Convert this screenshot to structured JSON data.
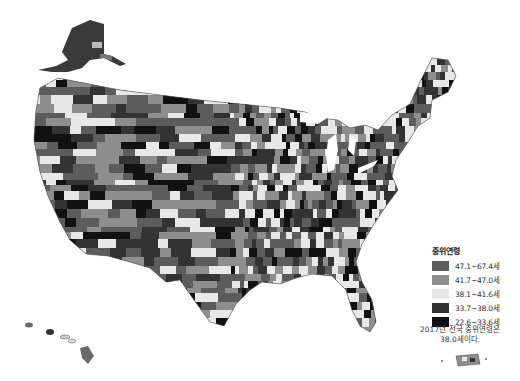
{
  "map": {
    "subject": "US county median age (2017)",
    "regions_shown": [
      "contiguous-us",
      "alaska",
      "hawaii",
      "puerto-rico"
    ],
    "classes": [
      {
        "label": "47.1~67.4세",
        "color": "#5c5c5c"
      },
      {
        "label": "41.7~47.0세",
        "color": "#8e8e8e"
      },
      {
        "label": "38.1~41.6세",
        "color": "#e8e8e8"
      },
      {
        "label": "33.7~38.0세",
        "color": "#333333"
      },
      {
        "label": "22.6~33.6세",
        "color": "#111111"
      }
    ]
  },
  "legend": {
    "title": "중위연령",
    "items": [
      {
        "label": "47.1~67.4세",
        "color": "#5c5c5c"
      },
      {
        "label": "41.7~47.0세",
        "color": "#8e8e8e"
      },
      {
        "label": "38.1~41.6세",
        "color": "#e8e8e8"
      },
      {
        "label": "33.7~38.0세",
        "color": "#333333"
      },
      {
        "label": "22.6~33.6세",
        "color": "#111111"
      }
    ],
    "note_line1": "2017년 전국 중위연령은",
    "note_line2": "38.0세이다."
  }
}
